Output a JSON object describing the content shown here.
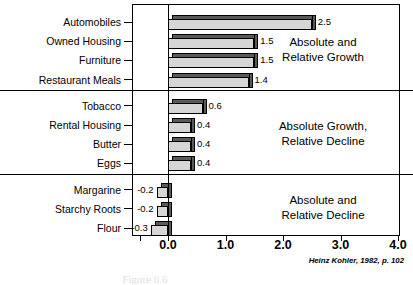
{
  "chart_data": {
    "type": "bar",
    "orientation": "horizontal",
    "title": "",
    "xlabel": "",
    "ylabel": "",
    "xlim": [
      -0.55,
      4.35
    ],
    "xticks": [
      "0.0",
      "1.0",
      "2.0",
      "3.0",
      "4.0"
    ],
    "xtickvalues": [
      0.0,
      1.0,
      2.0,
      3.0,
      4.0
    ],
    "grid": false,
    "legend": null,
    "categories": [
      "Automobiles",
      "Owned Housing",
      "Furniture",
      "Restaurant Meals",
      "Tobacco",
      "Rental Housing",
      "Butter",
      "Eggs",
      "Margarine",
      "Starchy Roots",
      "Flour"
    ],
    "values": [
      2.5,
      1.5,
      1.5,
      1.4,
      0.6,
      0.4,
      0.4,
      0.4,
      -0.2,
      -0.2,
      -0.3
    ],
    "value_labels": [
      "2.5",
      "1.5",
      "1.5",
      "1.4",
      "0.6",
      "0.4",
      "0.4",
      "0.4",
      "-0.2",
      "-0.2",
      "-0.3"
    ],
    "groups": [
      {
        "name": "Absolute and Relative Growth",
        "categories": [
          "Automobiles",
          "Owned Housing",
          "Furniture",
          "Restaurant Meals"
        ]
      },
      {
        "name": "Absolute Growth, Relative Decline",
        "categories": [
          "Tobacco",
          "Rental Housing",
          "Butter",
          "Eggs"
        ]
      },
      {
        "name": "Absolute and Relative Decline",
        "categories": [
          "Margarine",
          "Starchy Roots",
          "Flour"
        ]
      }
    ],
    "annotations": [
      {
        "line1": "Absolute and",
        "line2": "Relative Growth"
      },
      {
        "line1": "Absolute Growth,",
        "line2": "Relative Decline"
      },
      {
        "line1": "Absolute and",
        "line2": "Relative Decline"
      }
    ],
    "source": "Heinz Kohler, 1982, p. 102",
    "caption": "Figure 6.6",
    "colors": {
      "bar_front": "#d6d6d6",
      "bar_shadow": "#5a5a5a",
      "outline": "#000000",
      "background": "#ffffff"
    }
  },
  "rows": [
    {
      "label": "Automobiles",
      "value": "2.5"
    },
    {
      "label": "Owned Housing",
      "value": "1.5"
    },
    {
      "label": "Furniture",
      "value": "1.5"
    },
    {
      "label": "Restaurant Meals",
      "value": "1.4"
    },
    {
      "label": "Tobacco",
      "value": "0.6"
    },
    {
      "label": "Rental Housing",
      "value": "0.4"
    },
    {
      "label": "Butter",
      "value": "0.4"
    },
    {
      "label": "Eggs",
      "value": "0.4"
    },
    {
      "label": "Margarine",
      "value": "-0.2"
    },
    {
      "label": "Starchy Roots",
      "value": "-0.2"
    },
    {
      "label": "Flour",
      "value": "-0.3"
    }
  ],
  "annotations": [
    {
      "line1": "Absolute and",
      "line2": "Relative Growth"
    },
    {
      "line1": "Absolute Growth,",
      "line2": "Relative Decline"
    },
    {
      "line1": "Absolute and",
      "line2": "Relative Decline"
    }
  ],
  "axis": {
    "ticks": [
      "0.0",
      "1.0",
      "2.0",
      "3.0",
      "4.0"
    ]
  },
  "source": "Heinz Kohler, 1982, p. 102",
  "caption": "Figure 6.6"
}
